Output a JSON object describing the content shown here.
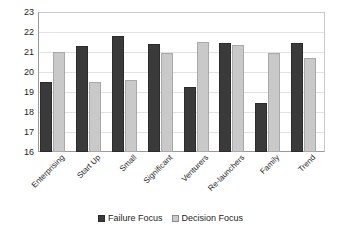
{
  "chart_data": {
    "type": "bar",
    "title": "",
    "xlabel": "",
    "ylabel": "",
    "ylim": [
      16,
      23
    ],
    "yticks": [
      16,
      17,
      18,
      19,
      20,
      21,
      22,
      23
    ],
    "grid": true,
    "legend_position": "bottom",
    "categories": [
      "Enterprising",
      "Start Up",
      "Small",
      "Significant",
      "Venturers",
      "Re-launchers",
      "Family",
      "Trend"
    ],
    "series": [
      {
        "name": "Failure Focus",
        "color": "#3a3a3a",
        "values": [
          19.5,
          21.3,
          21.8,
          21.4,
          19.25,
          21.45,
          18.45,
          21.45
        ]
      },
      {
        "name": "Decision Focus",
        "color": "#c9c9c9",
        "values": [
          21.0,
          19.5,
          19.6,
          20.95,
          21.5,
          21.35,
          20.95,
          20.7
        ]
      }
    ]
  }
}
